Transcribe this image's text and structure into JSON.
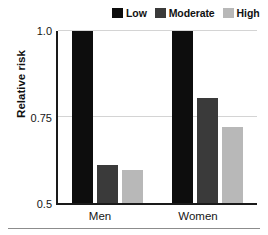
{
  "chart_data": {
    "type": "bar",
    "title": "",
    "xlabel": "",
    "ylabel": "Relative risk",
    "categories": [
      "Men",
      "Women"
    ],
    "series": [
      {
        "name": "Low",
        "color": "#0d0d0d",
        "values": [
          1.0,
          1.0
        ]
      },
      {
        "name": "Moderate",
        "color": "#3a3a3a",
        "values": [
          0.61,
          0.805
        ]
      },
      {
        "name": "High",
        "color": "#b8b8b8",
        "values": [
          0.595,
          0.72
        ]
      }
    ],
    "ylim": [
      0.5,
      1.0
    ],
    "yticks": [
      "0.5",
      "0.75",
      "1.0"
    ],
    "ytick_values": [
      0.5,
      0.75,
      1.0
    ],
    "grid": "horizontal",
    "legend_position": "top-right"
  },
  "legend": {
    "entries": [
      {
        "label": "Low",
        "swatch": "legend-swatch-low"
      },
      {
        "label": "Moderate",
        "swatch": "legend-swatch-moderate"
      },
      {
        "label": "High",
        "swatch": "legend-swatch-high"
      }
    ]
  },
  "axes": {
    "y_title": "Relative risk",
    "y_tick_top": "1.0",
    "y_tick_mid": "0.75",
    "y_tick_bottom": "0.5",
    "x_tick_1": "Men",
    "x_tick_2": "Women"
  }
}
